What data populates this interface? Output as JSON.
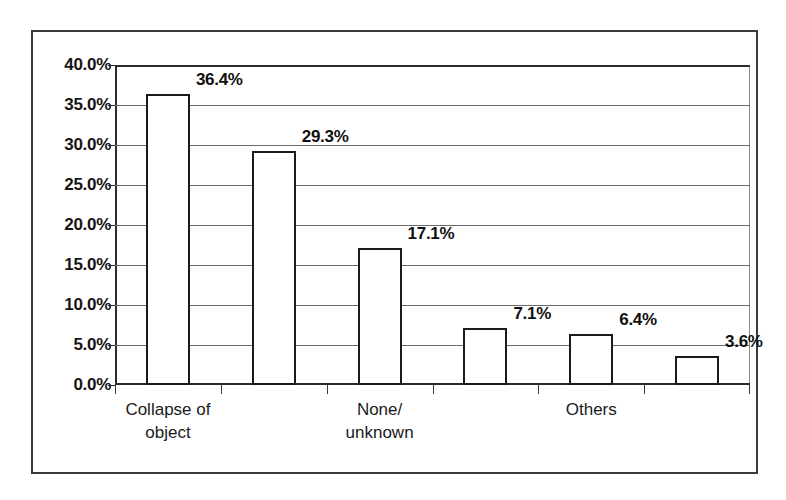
{
  "chart_data": {
    "type": "bar",
    "title": "",
    "subtitle": "",
    "xlabel": "",
    "ylabel": "",
    "categories": [
      "Collapse of object",
      "",
      "None/ unknown",
      "",
      "Others",
      ""
    ],
    "category_lines": [
      [
        "Collapse of",
        "object"
      ],
      [],
      [
        "None/",
        "unknown"
      ],
      [],
      [
        "Others"
      ],
      []
    ],
    "values": [
      36.4,
      29.3,
      17.1,
      7.1,
      6.4,
      3.6
    ],
    "value_labels": [
      "36.4%",
      "29.3%",
      "17.1%",
      "7.1%",
      "6.4%",
      "3.6%"
    ],
    "ylim": [
      0,
      40
    ],
    "ytick_step": 5,
    "ytick_labels": [
      "40.0%",
      "35.0%",
      "30.0%",
      "25.0%",
      "20.0%",
      "15.0%",
      "10.0%",
      "5.0%",
      "0.0%"
    ],
    "ytick_values": [
      40,
      35,
      30,
      25,
      20,
      15,
      10,
      5,
      0
    ],
    "grid": true,
    "legend": false,
    "legend_position": "none",
    "bar_fill": "#ffffff",
    "bar_border": "#1a1a1a",
    "gridline_color": "#6b6b6b",
    "axis_color": "#2b2b2b",
    "frame_color": "#3a3a3a",
    "background": "#ffffff"
  }
}
